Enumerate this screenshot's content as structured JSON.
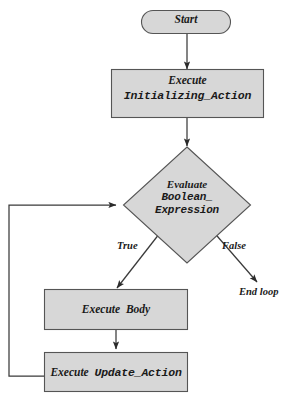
{
  "diagram": {
    "style": {
      "node_fill": "#d7d7d7",
      "node_stroke": "#555555",
      "line_color": "#3a3a3a",
      "text_color": "#1a1a1a",
      "background": "#ffffff"
    },
    "nodes": [
      {
        "id": "start",
        "shape": "rounded-rectangle",
        "label": "Start"
      },
      {
        "id": "init",
        "shape": "rectangle",
        "label_line1": "Execute",
        "label_line2": "Initializing_Action"
      },
      {
        "id": "decision",
        "shape": "diamond",
        "label_line1": "Evaluate",
        "label_line2": "Boolean_",
        "label_line3": "Expression"
      },
      {
        "id": "body",
        "shape": "rectangle",
        "label_line1": "Execute",
        "label_line2": "Body"
      },
      {
        "id": "update",
        "shape": "rectangle",
        "label_line1": "Execute",
        "label_line2": "Update_Action"
      }
    ],
    "edge_labels": {
      "true_branch": "True",
      "false_branch": "False",
      "exit": "End loop"
    }
  }
}
